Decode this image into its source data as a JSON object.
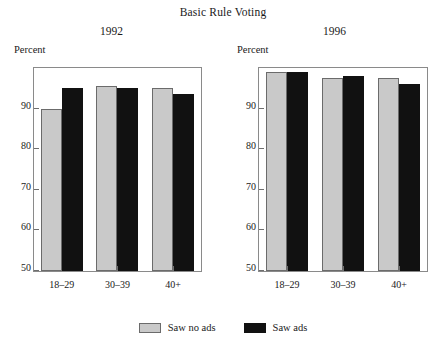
{
  "chart_data": {
    "type": "bar",
    "title": "Basic Rule Voting",
    "xlabel": "",
    "ylabel": "Percent",
    "ylim": [
      50,
      100
    ],
    "yticks": [
      50,
      60,
      70,
      80,
      90
    ],
    "grid": false,
    "legend_position": "bottom-center",
    "categories": [
      "18–29",
      "30–39",
      "40+"
    ],
    "panels": [
      {
        "name": "1992",
        "axis_label": "Percent",
        "series": [
          {
            "name": "Saw no ads",
            "color": "#c9c9c9",
            "values": [
              90,
              95.5,
              95
            ]
          },
          {
            "name": "Saw ads",
            "color": "#111111",
            "values": [
              95,
              95,
              93.5
            ]
          }
        ]
      },
      {
        "name": "1996",
        "axis_label": "Percent",
        "series": [
          {
            "name": "Saw no ads",
            "color": "#c9c9c9",
            "values": [
              99,
              97.5,
              97.5
            ]
          },
          {
            "name": "Saw ads",
            "color": "#111111",
            "values": [
              99,
              98,
              96
            ]
          }
        ]
      }
    ],
    "legend": [
      {
        "label": "Saw no ads",
        "color": "#c9c9c9"
      },
      {
        "label": "Saw ads",
        "color": "#111111"
      }
    ]
  }
}
